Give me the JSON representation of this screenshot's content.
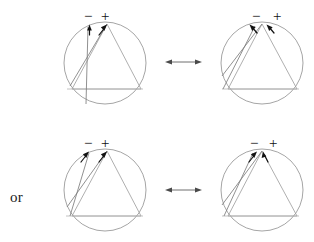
{
  "figure": {
    "background_color": "#ffffff",
    "width": 314,
    "height": 242,
    "connector_label": "or",
    "stroke_colors": {
      "circle": "#8e8e8e",
      "triangle": "#9a9a9a",
      "chord": "#7d7d7d",
      "base": "#b3b3b3",
      "pointer": "#121212",
      "double_arrow": "#5d5d5d"
    },
    "rows": [
      {
        "id": "row-top",
        "panels": [
          {
            "id": "panel-top-left",
            "position": "top-left",
            "cx": 105,
            "cy": 63,
            "r": 41,
            "minus_label": "−",
            "plus_label": "+",
            "minus_x": 84,
            "minus_y": 21,
            "plus_x": 103,
            "plus_y": 19,
            "triangle": [
              [
                107,
                24
              ],
              [
                72,
                89
              ],
              [
                141,
                89
              ]
            ],
            "chords": [
              [
                107,
                24,
                70,
                86
              ],
              [
                107,
                24,
                85,
                103
              ]
            ],
            "base": [
              [
                67,
                89
              ],
              [
                143,
                89
              ]
            ],
            "pointers": [
              {
                "x1": 89,
                "y1": 34,
                "x2": 90,
                "y2": 26,
                "dir": "up"
              },
              {
                "x1": 100,
                "y1": 34,
                "x2": 106,
                "y2": 26,
                "dir": "upright"
              }
            ]
          },
          {
            "id": "panel-top-right",
            "position": "top-right",
            "cx": 262,
            "cy": 63,
            "r": 41,
            "minus_label": "−",
            "plus_label": "+",
            "minus_x": 252,
            "minus_y": 21,
            "plus_x": 274,
            "plus_y": 19,
            "triangle": [
              [
                262,
                24
              ],
              [
                228,
                89
              ],
              [
                297,
                89
              ]
            ],
            "chords": [
              [
                262,
                24,
                223,
                76
              ],
              [
                262,
                24,
                224,
                89
              ]
            ],
            "base": [
              [
                222,
                89
              ],
              [
                299,
                89
              ]
            ],
            "pointers": [
              {
                "x1": 252,
                "y1": 26,
                "x2": 258,
                "y2": 34,
                "dir": "downright"
              },
              {
                "x1": 270,
                "y1": 26,
                "x2": 276,
                "y2": 34,
                "dir": "downright"
              }
            ]
          }
        ],
        "double_arrow": {
          "x1": 165,
          "y1": 62,
          "x2": 202,
          "y2": 62
        }
      },
      {
        "id": "row-bottom",
        "panels": [
          {
            "id": "panel-bottom-left",
            "position": "bottom-left",
            "cx": 105,
            "cy": 190,
            "r": 41,
            "minus_label": "−",
            "plus_label": "+",
            "minus_x": 84,
            "minus_y": 148,
            "plus_x": 103,
            "plus_y": 146,
            "triangle": [
              [
                107,
                151
              ],
              [
                72,
                216
              ],
              [
                141,
                216
              ]
            ],
            "chords": [
              [
                107,
                151,
                68,
                210
              ],
              [
                107,
                151,
                70,
                216
              ]
            ],
            "base": [
              [
                66,
                216
              ],
              [
                143,
                216
              ]
            ],
            "pointers": [
              {
                "x1": 82,
                "y1": 161,
                "x2": 88,
                "y2": 153,
                "dir": "upright"
              },
              {
                "x1": 100,
                "y1": 161,
                "x2": 106,
                "y2": 153,
                "dir": "upright"
              }
            ]
          },
          {
            "id": "panel-bottom-right",
            "position": "bottom-right",
            "cx": 262,
            "cy": 190,
            "r": 41,
            "minus_label": "−",
            "plus_label": "+",
            "minus_x": 250,
            "minus_y": 148,
            "plus_x": 271,
            "plus_y": 146,
            "triangle": [
              [
                262,
                151
              ],
              [
                228,
                216
              ],
              [
                297,
                216
              ]
            ],
            "chords": [
              [
                262,
                151,
                223,
                207
              ],
              [
                255,
                154,
                224,
                216
              ]
            ],
            "base": [
              [
                222,
                216
              ],
              [
                299,
                216
              ]
            ],
            "pointers": [
              {
                "x1": 250,
                "y1": 161,
                "x2": 256,
                "y2": 153,
                "dir": "upright"
              },
              {
                "x1": 266,
                "y1": 161,
                "x2": 264,
                "y2": 153,
                "dir": "up"
              }
            ]
          }
        ],
        "double_arrow": {
          "x1": 165,
          "y1": 190,
          "x2": 202,
          "y2": 190
        }
      }
    ]
  }
}
